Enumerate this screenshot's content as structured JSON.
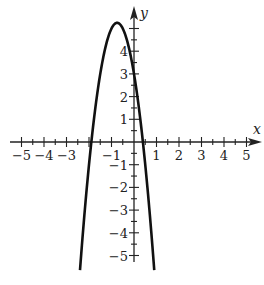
{
  "chart_data": {
    "type": "line",
    "title": "",
    "xlabel": "x",
    "ylabel": "y",
    "xlim": [
      -5,
      5
    ],
    "ylim": [
      -5,
      5
    ],
    "grid": false,
    "legend": null,
    "x_tick_labels": [
      "-5",
      "-4",
      "-3",
      "-1",
      "1",
      "2",
      "3",
      "4",
      "5"
    ],
    "x_tick_values": [
      -5,
      -4,
      -3,
      -1,
      1,
      2,
      3,
      4,
      5
    ],
    "y_tick_labels": [
      "4",
      "3",
      "2",
      "1",
      "-1",
      "-2",
      "-3",
      "-4",
      "-5"
    ],
    "y_tick_values": [
      4,
      3,
      2,
      1,
      -1,
      -2,
      -3,
      -4,
      -5
    ],
    "minor_tick_step": 0.5,
    "series": [
      {
        "name": "parabola",
        "equation": "y = -4x^2 - 6x + 3",
        "coefficients": {
          "a": -4,
          "b": -6,
          "c": 3
        },
        "vertex": [
          -0.75,
          5.25
        ],
        "x_intercepts": [
          -1.9,
          0.4
        ],
        "y_intercept": 3,
        "x_range": [
          -2.4,
          0.9
        ],
        "color": "#111111"
      }
    ]
  },
  "layout": {
    "origin_px": [
      134,
      142
    ],
    "unit_x_px": 22.5,
    "unit_y_px": 22.7,
    "axis_color": "#222222"
  }
}
